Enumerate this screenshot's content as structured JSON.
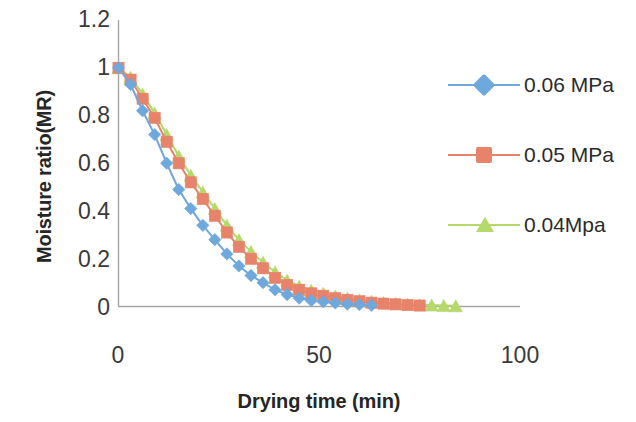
{
  "chart_data": {
    "type": "line",
    "title": "",
    "xlabel": "Drying time (min)",
    "ylabel": "Moisture ratio(MR)",
    "xlim": [
      0,
      100
    ],
    "ylim": [
      0,
      1.2
    ],
    "xticks": [
      "0",
      "50",
      "100"
    ],
    "xtick_values": [
      0,
      50,
      100
    ],
    "yticks": [
      "0",
      "0.2",
      "0.4",
      "0.6",
      "0.8",
      "1",
      "1.2"
    ],
    "ytick_values": [
      0,
      0.2,
      0.4,
      0.6,
      0.8,
      1,
      1.2
    ],
    "grid": false,
    "legend_position": "right",
    "series": [
      {
        "name": "0.06 MPa",
        "color": "#6fa8dc",
        "marker": "diamond",
        "x": [
          0,
          3,
          6,
          9,
          12,
          15,
          18,
          21,
          24,
          27,
          30,
          33,
          36,
          39,
          42,
          45,
          48,
          51,
          54,
          57,
          60,
          63
        ],
        "y": [
          1.0,
          0.93,
          0.82,
          0.72,
          0.6,
          0.49,
          0.41,
          0.34,
          0.28,
          0.22,
          0.17,
          0.13,
          0.1,
          0.07,
          0.05,
          0.035,
          0.025,
          0.02,
          0.015,
          0.01,
          0.008,
          0.005
        ]
      },
      {
        "name": "0.05 MPa",
        "color": "#e8836b",
        "marker": "square",
        "x": [
          0,
          3,
          6,
          9,
          12,
          15,
          18,
          21,
          24,
          27,
          30,
          33,
          36,
          39,
          42,
          45,
          48,
          51,
          54,
          57,
          60,
          63,
          66,
          69,
          72,
          75
        ],
        "y": [
          1.0,
          0.95,
          0.87,
          0.79,
          0.69,
          0.6,
          0.52,
          0.45,
          0.38,
          0.31,
          0.25,
          0.2,
          0.16,
          0.12,
          0.09,
          0.07,
          0.055,
          0.045,
          0.035,
          0.028,
          0.022,
          0.016,
          0.012,
          0.009,
          0.006,
          0.004
        ]
      },
      {
        "name": "0.04Mpa",
        "color": "#b5d96b",
        "marker": "triangle",
        "x": [
          0,
          3,
          6,
          9,
          12,
          15,
          18,
          21,
          24,
          27,
          30,
          33,
          36,
          39,
          42,
          45,
          48,
          51,
          54,
          57,
          60,
          63,
          66,
          69,
          72,
          75,
          78,
          81,
          84
        ],
        "y": [
          1.0,
          0.96,
          0.89,
          0.81,
          0.72,
          0.63,
          0.55,
          0.48,
          0.41,
          0.34,
          0.28,
          0.23,
          0.185,
          0.145,
          0.11,
          0.085,
          0.068,
          0.055,
          0.044,
          0.035,
          0.028,
          0.022,
          0.017,
          0.013,
          0.01,
          0.008,
          0.006,
          0.004,
          0.003
        ]
      }
    ]
  },
  "legend": {
    "items": [
      {
        "label": "0.06 MPa"
      },
      {
        "label": "0.05 MPa"
      },
      {
        "label": "0.04Mpa"
      }
    ]
  },
  "axes": {
    "x_title": "Drying time (min)",
    "y_title": "Moisture ratio(MR)"
  }
}
